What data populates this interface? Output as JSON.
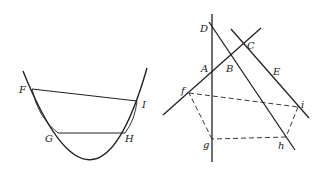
{
  "figure_left": {
    "title": "Parabola with chords",
    "labels": {
      "F": "F",
      "I": "I",
      "G": "G",
      "H": "H"
    },
    "points": {
      "F": [
        32,
        89
      ],
      "I": [
        137,
        101
      ],
      "G": [
        58,
        133
      ],
      "H": [
        125,
        133
      ]
    }
  },
  "figure_right": {
    "title": "Lines and dashed pentagon",
    "labels": {
      "D": "D",
      "C": "C",
      "A": "A",
      "B": "B",
      "E": "E",
      "f": "f",
      "i": "i",
      "g": "g",
      "h": "h"
    },
    "points": {
      "f": [
        189,
        93
      ],
      "i": [
        298,
        107
      ],
      "g": [
        212,
        139
      ],
      "h": [
        286,
        137
      ]
    }
  },
  "colors": {
    "stroke": "#222222",
    "background": "#ffffff"
  }
}
